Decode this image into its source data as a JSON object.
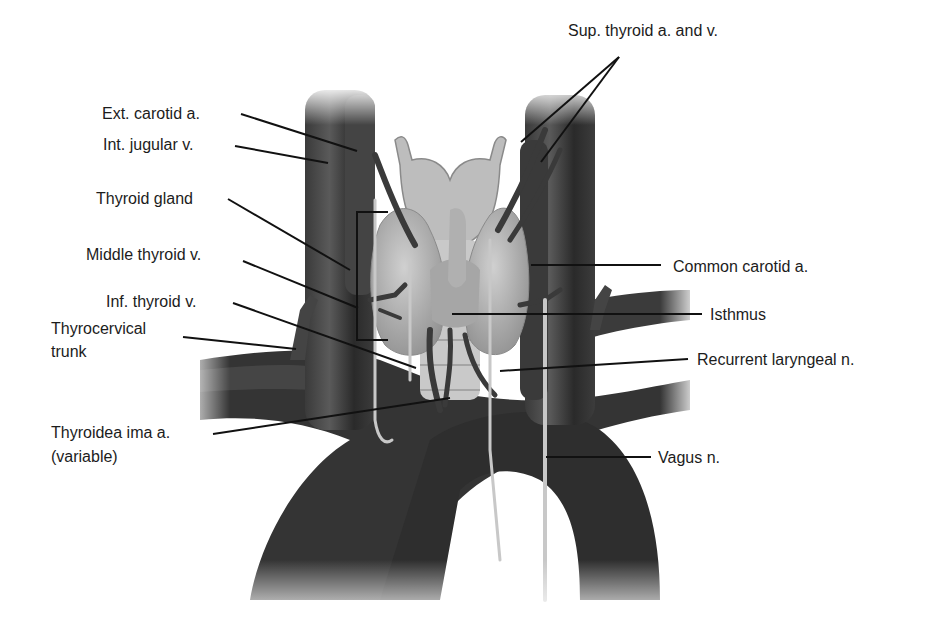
{
  "diagram": {
    "type": "anatomical-illustration",
    "colors": {
      "background": "#ffffff",
      "vessel_dark": "#2e2e2e",
      "vessel_mid": "#4a4a4a",
      "gland": "#a9a9a9",
      "gland_light": "#c4c4c4",
      "nerve": "#bdbdbd",
      "leader_line": "#111111",
      "text": "#1c1c1c"
    },
    "labels": {
      "ext_carotid": "Ext. carotid a.",
      "int_jugular": "Int. jugular v.",
      "thyroid_gland": "Thyroid gland",
      "middle_thyroid": "Middle thyroid v.",
      "inf_thyroid": "Inf. thyroid v.",
      "thyrocervical_1": "Thyrocervical",
      "thyrocervical_2": "trunk",
      "thyroidea_ima_1": "Thyroidea ima a.",
      "thyroidea_ima_2": "(variable)",
      "sup_thyroid": "Sup. thyroid a. and v.",
      "common_carotid": "Common carotid a.",
      "isthmus": "Isthmus",
      "recurrent_laryngeal": "Recurrent laryngeal n.",
      "vagus": "Vagus n."
    }
  }
}
